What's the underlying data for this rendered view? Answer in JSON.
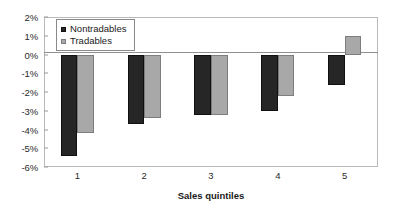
{
  "chart_data": {
    "type": "bar",
    "title": "",
    "xlabel": "Sales quintiles",
    "ylabel": "",
    "categories": [
      "1",
      "2",
      "3",
      "4",
      "5"
    ],
    "series": [
      {
        "name": "Nontradables",
        "color": "#262626",
        "values": [
          -5.4,
          -3.7,
          -3.2,
          -3.0,
          -1.6
        ]
      },
      {
        "name": "Tradables",
        "color": "#a8a8a8",
        "values": [
          -4.2,
          -3.4,
          -3.2,
          -2.2,
          1.0
        ]
      }
    ],
    "ylim": [
      -6,
      2
    ],
    "yticks": [
      2,
      1,
      0,
      -1,
      -2,
      -3,
      -4,
      -5,
      -6
    ],
    "ytick_labels": [
      "2%",
      "1%",
      "0%",
      "-1%",
      "-2%",
      "-3%",
      "-4%",
      "-5%",
      "-6%"
    ],
    "grid": false,
    "legend_position": "top-left",
    "value_suffix": "%"
  }
}
